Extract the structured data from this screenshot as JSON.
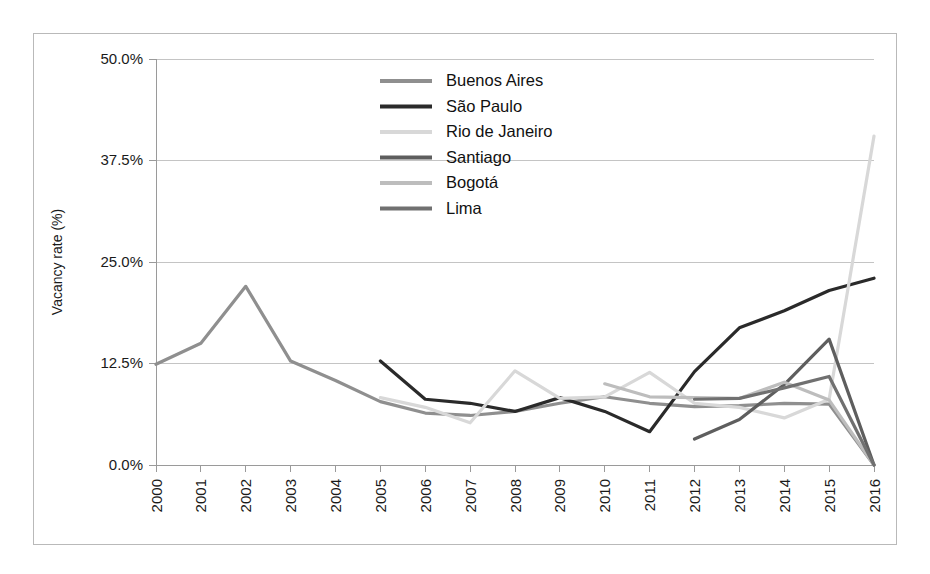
{
  "figure": {
    "background": "#ffffff",
    "border_color": "#b9b9b9"
  },
  "chart_data": {
    "type": "line",
    "title": "",
    "subtitle": "",
    "xlabel": "",
    "ylabel": "Vacancy rate (%)",
    "grid": true,
    "legend_position": "top-center-inside",
    "xlim": [
      "2000",
      "2016"
    ],
    "ylim": [
      0,
      50
    ],
    "ytick_labels": [
      "0.0%",
      "12.5%",
      "25.0%",
      "37.5%",
      "50.0%"
    ],
    "ytick_values": [
      0,
      12.5,
      25,
      37.5,
      50
    ],
    "categories": [
      "2000",
      "2001",
      "2002",
      "2003",
      "2004",
      "2005",
      "2006",
      "2007",
      "2008",
      "2009",
      "2010",
      "2011",
      "2012",
      "2013",
      "2014",
      "2015",
      "2016"
    ],
    "series": [
      {
        "name": "Buenos Aires",
        "color": "#8f8f8f",
        "values": [
          12.4,
          15.0,
          22.0,
          12.8,
          10.4,
          7.8,
          6.4,
          6.1,
          6.6,
          7.6,
          8.4,
          7.6,
          7.2,
          7.3,
          7.6,
          7.5,
          0.0
        ]
      },
      {
        "name": "São Paulo",
        "color": "#2a2a2a",
        "values": [
          null,
          null,
          null,
          null,
          null,
          12.8,
          8.1,
          7.6,
          6.6,
          8.3,
          6.6,
          4.1,
          11.5,
          16.9,
          19.0,
          21.5,
          23.0
        ]
      },
      {
        "name": "Rio de Janeiro",
        "color": "#d8d8d8",
        "values": [
          null,
          null,
          null,
          null,
          null,
          8.3,
          7.1,
          5.2,
          11.6,
          8.2,
          8.4,
          11.4,
          7.6,
          7.1,
          5.8,
          8.1,
          40.5
        ]
      },
      {
        "name": "Santiago",
        "color": "#5e5e5e",
        "values": [
          null,
          null,
          null,
          null,
          null,
          null,
          null,
          null,
          null,
          null,
          null,
          null,
          3.2,
          5.6,
          9.9,
          15.5,
          0.0
        ]
      },
      {
        "name": "Bogotá",
        "color": "#bdbdbd",
        "values": [
          null,
          null,
          null,
          null,
          null,
          null,
          null,
          null,
          null,
          null,
          10.0,
          8.4,
          8.3,
          8.2,
          10.2,
          8.0,
          0.0
        ]
      },
      {
        "name": "Lima",
        "color": "#707070",
        "values": [
          null,
          null,
          null,
          null,
          null,
          null,
          null,
          null,
          null,
          null,
          null,
          null,
          8.1,
          8.2,
          9.5,
          10.9,
          0.0
        ]
      }
    ]
  },
  "legend": {
    "entries": [
      {
        "label": "Buenos Aires",
        "color": "#8f8f8f"
      },
      {
        "label": "São Paulo",
        "color": "#2a2a2a"
      },
      {
        "label": "Rio de Janeiro",
        "color": "#d8d8d8"
      },
      {
        "label": "Santiago",
        "color": "#5e5e5e"
      },
      {
        "label": "Bogotá",
        "color": "#bdbdbd"
      },
      {
        "label": "Lima",
        "color": "#707070"
      }
    ]
  }
}
